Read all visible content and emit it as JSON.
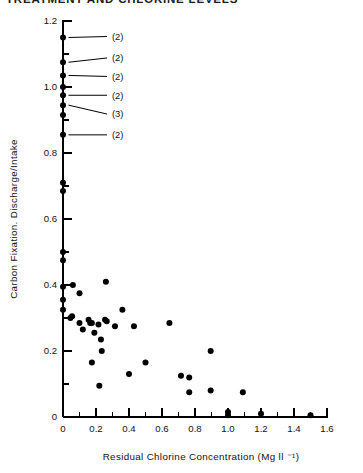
{
  "header": {
    "clipped_title": "TREATMENT AND CHLORINE LEVELS"
  },
  "chart_data": {
    "type": "scatter",
    "title": "",
    "xlabel": "Residual Chlorine Concentration (Mg ll ⁻¹)",
    "ylabel": "Carbon Fixation. Discharge/Intake",
    "xlim": [
      -0.1,
      1.6
    ],
    "ylim": [
      0,
      1.2
    ],
    "xticks": [
      0,
      0.2,
      0.4,
      0.6,
      0.8,
      1.0,
      1.2,
      1.4,
      1.6
    ],
    "xtick_labels": [
      "0",
      "0.2",
      "0.4",
      "0.6",
      "0.8",
      "1.0",
      "1.2",
      "1.4",
      "1.6"
    ],
    "xminor_step": 0.1,
    "yticks": [
      0,
      0.2,
      0.4,
      0.6,
      0.8,
      1.0,
      1.2
    ],
    "ytick_labels": [
      "0",
      "0.2",
      "0.4",
      "0.6",
      "0.8",
      "1.0",
      "1.2"
    ],
    "yminor_step": 0.1,
    "grid": false,
    "legend": null,
    "marker": "filled-circle",
    "marker_color": "#000000",
    "points": [
      {
        "x": 0.0,
        "y": 1.15
      },
      {
        "x": 0.0,
        "y": 1.075
      },
      {
        "x": 0.0,
        "y": 1.035
      },
      {
        "x": 0.0,
        "y": 1.0
      },
      {
        "x": 0.0,
        "y": 0.975
      },
      {
        "x": 0.0,
        "y": 0.945
      },
      {
        "x": 0.0,
        "y": 0.915
      },
      {
        "x": 0.0,
        "y": 0.855
      },
      {
        "x": 0.0,
        "y": 0.71
      },
      {
        "x": 0.0,
        "y": 0.685
      },
      {
        "x": 0.0,
        "y": 0.5
      },
      {
        "x": 0.0,
        "y": 0.475
      },
      {
        "x": 0.0,
        "y": 0.395
      },
      {
        "x": 0.0,
        "y": 0.355
      },
      {
        "x": 0.0,
        "y": 0.325
      },
      {
        "x": 0.06,
        "y": 0.4
      },
      {
        "x": 0.055,
        "y": 0.305
      },
      {
        "x": 0.1,
        "y": 0.375
      },
      {
        "x": 0.1,
        "y": 0.285
      },
      {
        "x": 0.045,
        "y": 0.3
      },
      {
        "x": 0.12,
        "y": 0.265
      },
      {
        "x": 0.155,
        "y": 0.295
      },
      {
        "x": 0.165,
        "y": 0.285
      },
      {
        "x": 0.175,
        "y": 0.285
      },
      {
        "x": 0.19,
        "y": 0.255
      },
      {
        "x": 0.215,
        "y": 0.28
      },
      {
        "x": 0.23,
        "y": 0.235
      },
      {
        "x": 0.175,
        "y": 0.165
      },
      {
        "x": 0.255,
        "y": 0.295
      },
      {
        "x": 0.265,
        "y": 0.29
      },
      {
        "x": 0.26,
        "y": 0.41
      },
      {
        "x": 0.315,
        "y": 0.275
      },
      {
        "x": 0.235,
        "y": 0.2
      },
      {
        "x": 0.22,
        "y": 0.095
      },
      {
        "x": 0.36,
        "y": 0.325
      },
      {
        "x": 0.4,
        "y": 0.13
      },
      {
        "x": 0.43,
        "y": 0.275
      },
      {
        "x": 0.5,
        "y": 0.165
      },
      {
        "x": 0.645,
        "y": 0.285
      },
      {
        "x": 0.715,
        "y": 0.125
      },
      {
        "x": 0.765,
        "y": 0.12
      },
      {
        "x": 0.765,
        "y": 0.075
      },
      {
        "x": 0.895,
        "y": 0.2
      },
      {
        "x": 0.895,
        "y": 0.08
      },
      {
        "x": 1.09,
        "y": 0.075
      },
      {
        "x": 1.0,
        "y": 0.015
      },
      {
        "x": 1.0,
        "y": 0.005
      },
      {
        "x": 1.2,
        "y": 0.01
      },
      {
        "x": 1.5,
        "y": 0.005
      }
    ],
    "annotations": [
      {
        "label": "(2)",
        "point_x": 0.0,
        "point_y": 1.15,
        "note": "2 overlapping observations"
      },
      {
        "label": "(2)",
        "point_x": 0.0,
        "point_y": 1.075,
        "note": "2 overlapping observations"
      },
      {
        "label": "(2)",
        "point_x": 0.0,
        "point_y": 1.035,
        "note": "2 overlapping observations"
      },
      {
        "label": "(2)",
        "point_x": 0.0,
        "point_y": 0.975,
        "note": "2 overlapping observations"
      },
      {
        "label": "(3)",
        "point_x": 0.0,
        "point_y": 0.945,
        "note": "3 overlapping observations"
      },
      {
        "label": "(2)",
        "point_x": 0.0,
        "point_y": 0.855,
        "note": "2 overlapping observations"
      }
    ]
  }
}
